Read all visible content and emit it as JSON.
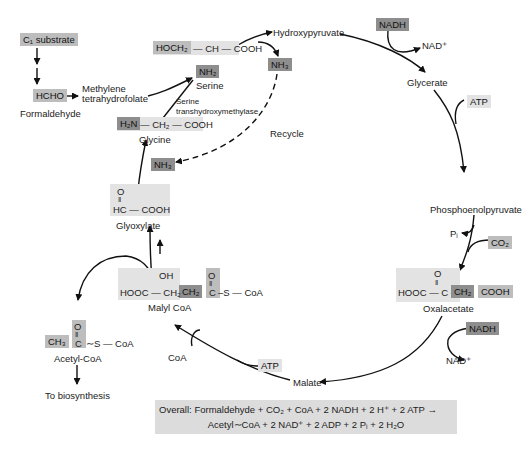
{
  "diagram": {
    "nodes": {
      "c1_substrate": "C₁ substrate",
      "hcho": "HCHO",
      "formaldehyde": "Formaldehyde",
      "methylene_thf_1": "Methylene",
      "methylene_thf_2": "tetrahydrofolate",
      "serine_formula_a": "HOCH₂",
      "serine_formula_b": "— CH — COOH",
      "serine_nh2": "NH₂",
      "serine": "Serine",
      "enzyme_1": "Serine",
      "enzyme_2": "transhydroxymethylase",
      "hydroxypyruvate": "Hydroxypyruvate",
      "nh3_top": "NH₃",
      "recycle": "Recycle",
      "nh3_bottom": "NH₃",
      "glycine_h2n": "H₂N",
      "glycine_rest": "— CH₂ — COOH",
      "glycine": "Glycine",
      "glyoxylate_o": "O",
      "glyoxylate_bond": "‖",
      "glyoxylate_formula": "HC — COOH",
      "glyoxylate": "Glyoxylate",
      "nadh_top": "NADH",
      "nad_top": "NAD⁺",
      "glycerate": "Glycerate",
      "atp_top": "ATP",
      "pep": "Phosphoenolpyruvate",
      "pi": "Pᵢ",
      "co2": "CO₂",
      "oxaloacetate_o": "O",
      "oxaloacetate_bond": "‖",
      "oxaloacetate_a": "HOOC — C —",
      "oxaloacetate_ch2": "CH₂",
      "oxaloacetate_cooh": "COOH",
      "oxaloacetate": "Oxalacetate",
      "nadh_bottom": "NADH",
      "nad_bottom": "NAD⁺",
      "malate": "Malate",
      "atp_bottom": "ATP",
      "coa": "CoA",
      "malyl_oh": "OH",
      "malyl_o": "O",
      "malyl_bond": "‖",
      "malyl_a": "HOOC — CH₂",
      "malyl_ch2": "CH₂",
      "malyl_c": "C",
      "malyl_scoa": "–S — CoA",
      "malyl_coa": "Malyl CoA",
      "acetyl_o": "O",
      "acetyl_bond": "‖",
      "acetyl_ch3": "CH₃",
      "acetyl_c": "C",
      "acetyl_scoa": "∼S — CoA",
      "acetyl_coa": "Acetyl-CoA",
      "to_biosynthesis": "To biosynthesis"
    },
    "overall": {
      "label": "Overall:",
      "line1": "Formaldehyde + CO₂ + CoA + 2 NADH + 2 H⁺ + 2 ATP →",
      "line2": "Acetyl∼CoA + 2 NAD⁺ + 2 ADP + 2 Pᵢ + 2 H₂O"
    },
    "colors": {
      "dark_highlight": "#8e8e8e",
      "mid_highlight": "#bdbdbd",
      "light_highlight": "#e3e3e3",
      "arrow": "#111111"
    }
  }
}
